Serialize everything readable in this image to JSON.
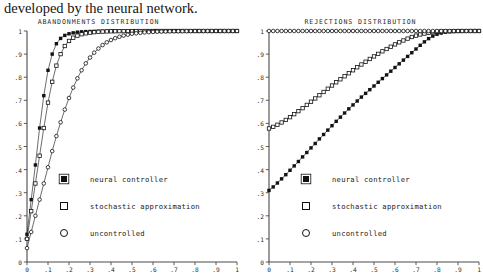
{
  "caption": {
    "text": "developed by the neural network."
  },
  "figure": {
    "panels": [
      {
        "id": "abandonments",
        "title": "ABANDONMENTS DISTRIBUTION",
        "legend": [
          {
            "marker": "filled-square",
            "label": "neural controller"
          },
          {
            "marker": "open-square",
            "label": "stochastic approximation"
          },
          {
            "marker": "open-circle",
            "label": "uncontrolled"
          }
        ]
      },
      {
        "id": "rejections",
        "title": "REJECTIONS DISTRIBUTION",
        "legend": [
          {
            "marker": "filled-square",
            "label": "neural controller"
          },
          {
            "marker": "open-square",
            "label": "stochastic approximation"
          },
          {
            "marker": "open-circle",
            "label": "uncontrolled"
          }
        ]
      }
    ]
  },
  "chart_data": [
    {
      "type": "line",
      "id": "abandonments",
      "title": "ABANDONMENTS DISTRIBUTION",
      "xlabel": "",
      "ylabel": "",
      "xlim": [
        0,
        1
      ],
      "ylim": [
        0,
        1
      ],
      "grid": false,
      "legend_position": "center-left-inside",
      "xticks": [
        0,
        0.1,
        0.2,
        0.3,
        0.4,
        0.5,
        0.6,
        0.7,
        0.8,
        0.9,
        1
      ],
      "xticklabels": [
        "0",
        ".1",
        ".2",
        ".3",
        ".4",
        ".5",
        ".6",
        ".7",
        ".8",
        ".9",
        "1"
      ],
      "yticks": [
        0,
        0.1,
        0.2,
        0.3,
        0.4,
        0.5,
        0.6,
        0.7,
        0.8,
        0.9,
        1
      ],
      "yticklabels": [
        "0",
        ".1",
        ".2",
        ".3",
        ".4",
        ".5",
        ".6",
        ".7",
        ".8",
        ".9",
        "1"
      ],
      "x": [
        0,
        0.02,
        0.04,
        0.06,
        0.08,
        0.1,
        0.12,
        0.14,
        0.16,
        0.18,
        0.2,
        0.22,
        0.24,
        0.26,
        0.28,
        0.3,
        0.32,
        0.34,
        0.36,
        0.38,
        0.4,
        0.42,
        0.44,
        0.46,
        0.48,
        0.5,
        0.52,
        0.54,
        0.56,
        0.58,
        0.6,
        0.62,
        0.64,
        0.66,
        0.68,
        0.7,
        0.72,
        0.74,
        0.76,
        0.78,
        0.8,
        0.82,
        0.84,
        0.86,
        0.88,
        0.9,
        0.92,
        0.94,
        0.96,
        0.98,
        1
      ],
      "series": [
        {
          "name": "neural controller",
          "marker": "filled-square",
          "values": [
            0.12,
            0.27,
            0.42,
            0.58,
            0.72,
            0.83,
            0.9,
            0.945,
            0.968,
            0.981,
            0.988,
            0.992,
            0.995,
            0.9965,
            0.9975,
            0.998,
            0.9985,
            0.999,
            0.9992,
            0.9994,
            0.9995,
            0.9996,
            0.9997,
            0.9997,
            0.9998,
            0.9998,
            0.9999,
            0.9999,
            0.9999,
            0.9999,
            1,
            1,
            1,
            1,
            1,
            1,
            1,
            1,
            1,
            1,
            1,
            1,
            1,
            1,
            1,
            1,
            1,
            1,
            1,
            1,
            1
          ]
        },
        {
          "name": "stochastic approximation",
          "marker": "open-square",
          "values": [
            0.1,
            0.22,
            0.34,
            0.46,
            0.58,
            0.69,
            0.78,
            0.85,
            0.9,
            0.935,
            0.957,
            0.971,
            0.98,
            0.986,
            0.99,
            0.993,
            0.995,
            0.9965,
            0.9975,
            0.9982,
            0.9987,
            0.999,
            0.9993,
            0.9995,
            0.9996,
            0.9997,
            0.9998,
            0.9998,
            0.9999,
            0.9999,
            0.9999,
            1,
            1,
            1,
            1,
            1,
            1,
            1,
            1,
            1,
            1,
            1,
            1,
            1,
            1,
            1,
            1,
            1,
            1,
            1,
            1
          ]
        },
        {
          "name": "uncontrolled",
          "marker": "open-circle",
          "values": [
            0.06,
            0.13,
            0.2,
            0.27,
            0.34,
            0.41,
            0.48,
            0.545,
            0.605,
            0.66,
            0.71,
            0.755,
            0.795,
            0.83,
            0.86,
            0.885,
            0.906,
            0.924,
            0.939,
            0.951,
            0.961,
            0.969,
            0.975,
            0.98,
            0.984,
            0.988,
            0.99,
            0.992,
            0.994,
            0.995,
            0.996,
            0.997,
            0.9975,
            0.998,
            0.9985,
            0.9988,
            0.999,
            0.9992,
            0.9994,
            0.9995,
            0.9996,
            0.9997,
            0.9997,
            0.9998,
            0.9998,
            0.9999,
            0.9999,
            0.9999,
            1,
            1,
            1
          ]
        }
      ]
    },
    {
      "type": "line",
      "id": "rejections",
      "title": "REJECTIONS DISTRIBUTION",
      "xlabel": "",
      "ylabel": "",
      "xlim": [
        0,
        1
      ],
      "ylim": [
        0,
        1
      ],
      "grid": false,
      "legend_position": "center-left-inside",
      "xticks": [
        0,
        0.1,
        0.2,
        0.3,
        0.4,
        0.5,
        0.6,
        0.7,
        0.8,
        0.9,
        1
      ],
      "xticklabels": [
        "0",
        ".1",
        ".2",
        ".3",
        ".4",
        ".5",
        ".6",
        ".7",
        ".8",
        ".9",
        "1"
      ],
      "yticks": [
        0,
        0.1,
        0.2,
        0.3,
        0.4,
        0.5,
        0.6,
        0.7,
        0.8,
        0.9,
        1
      ],
      "yticklabels": [
        "0",
        ".1",
        ".2",
        ".3",
        ".4",
        ".5",
        ".6",
        ".7",
        ".8",
        ".9",
        "1"
      ],
      "x": [
        0,
        0.02,
        0.04,
        0.06,
        0.08,
        0.1,
        0.12,
        0.14,
        0.16,
        0.18,
        0.2,
        0.22,
        0.24,
        0.26,
        0.28,
        0.3,
        0.32,
        0.34,
        0.36,
        0.38,
        0.4,
        0.42,
        0.44,
        0.46,
        0.48,
        0.5,
        0.52,
        0.54,
        0.56,
        0.58,
        0.6,
        0.62,
        0.64,
        0.66,
        0.68,
        0.7,
        0.72,
        0.74,
        0.76,
        0.78,
        0.8,
        0.82,
        0.84,
        0.86,
        0.88,
        0.9,
        0.92,
        0.94,
        0.96,
        0.98,
        1
      ],
      "series": [
        {
          "name": "neural controller",
          "marker": "filled-square",
          "values": [
            0.31,
            0.325,
            0.342,
            0.36,
            0.378,
            0.397,
            0.416,
            0.435,
            0.455,
            0.474,
            0.494,
            0.513,
            0.533,
            0.552,
            0.571,
            0.59,
            0.609,
            0.627,
            0.645,
            0.663,
            0.68,
            0.697,
            0.714,
            0.73,
            0.746,
            0.762,
            0.778,
            0.794,
            0.81,
            0.826,
            0.842,
            0.858,
            0.874,
            0.89,
            0.906,
            0.922,
            0.938,
            0.953,
            0.967,
            0.978,
            0.986,
            0.991,
            0.995,
            0.997,
            0.998,
            0.999,
            0.9995,
            0.9998,
            0.9999,
            1,
            1
          ]
        },
        {
          "name": "stochastic approximation",
          "marker": "open-square",
          "values": [
            0.578,
            0.585,
            0.594,
            0.604,
            0.615,
            0.627,
            0.64,
            0.653,
            0.666,
            0.68,
            0.694,
            0.708,
            0.722,
            0.736,
            0.75,
            0.764,
            0.778,
            0.791,
            0.804,
            0.817,
            0.83,
            0.843,
            0.855,
            0.867,
            0.879,
            0.89,
            0.901,
            0.912,
            0.922,
            0.932,
            0.942,
            0.951,
            0.959,
            0.967,
            0.974,
            0.98,
            0.985,
            0.989,
            0.992,
            0.995,
            0.997,
            0.998,
            0.999,
            0.9994,
            0.9997,
            0.9998,
            0.9999,
            1,
            1,
            1,
            1
          ]
        },
        {
          "name": "uncontrolled",
          "marker": "open-circle",
          "values": [
            1,
            1,
            1,
            1,
            1,
            1,
            1,
            1,
            1,
            1,
            1,
            1,
            1,
            1,
            1,
            1,
            1,
            1,
            1,
            1,
            1,
            1,
            1,
            1,
            1,
            1,
            1,
            1,
            1,
            1,
            1,
            1,
            1,
            1,
            1,
            1,
            1,
            1,
            1,
            1,
            1,
            1,
            1,
            1,
            1,
            1,
            1,
            1,
            1,
            1,
            1
          ]
        }
      ]
    }
  ]
}
